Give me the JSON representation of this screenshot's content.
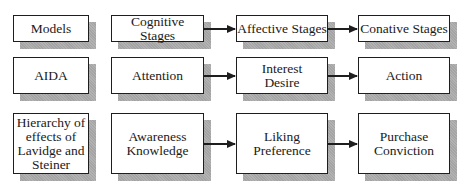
{
  "diagram": {
    "rows": [
      {
        "label": "Models",
        "stages": [
          "Cognitive Stages",
          "Affective Stages",
          "Conative Stages"
        ]
      },
      {
        "label": "AIDA",
        "stages": [
          "Attention",
          "Interest\nDesire",
          "Action"
        ]
      },
      {
        "label": "Hierarchy of\neffects of\nLavidge and\nSteiner",
        "stages": [
          "Awareness\nKnowledge",
          "Liking\nPreference",
          "Purchase\nConviction"
        ]
      }
    ],
    "colors": {
      "border": "#1e1e1e",
      "shadow": "#a9a9a9",
      "background": "#ffffff"
    }
  }
}
